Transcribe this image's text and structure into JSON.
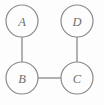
{
  "figure": {
    "background_color": "#fdfdfd",
    "stroke_color": "#8a8a8a",
    "label_color": "#6f6f6f"
  },
  "graph_data": {
    "type": "diagram",
    "diagram_kind": "node-link-graph",
    "directed": false,
    "node_radius": 16,
    "nodes": [
      {
        "id": "A",
        "label": "A",
        "cx": 22,
        "cy": 21
      },
      {
        "id": "D",
        "label": "D",
        "cx": 77,
        "cy": 21
      },
      {
        "id": "B",
        "label": "B",
        "cx": 22,
        "cy": 78
      },
      {
        "id": "C",
        "label": "C",
        "cx": 77,
        "cy": 78
      }
    ],
    "edges": [
      {
        "id": "A-B",
        "source": "A",
        "target": "B",
        "x1": 22,
        "y1": 37,
        "x2": 22,
        "y2": 62
      },
      {
        "id": "D-C",
        "source": "D",
        "target": "C",
        "x1": 77,
        "y1": 37,
        "x2": 77,
        "y2": 62
      },
      {
        "id": "B-C",
        "source": "B",
        "target": "C",
        "x1": 38,
        "y1": 78,
        "x2": 61,
        "y2": 78
      }
    ]
  }
}
